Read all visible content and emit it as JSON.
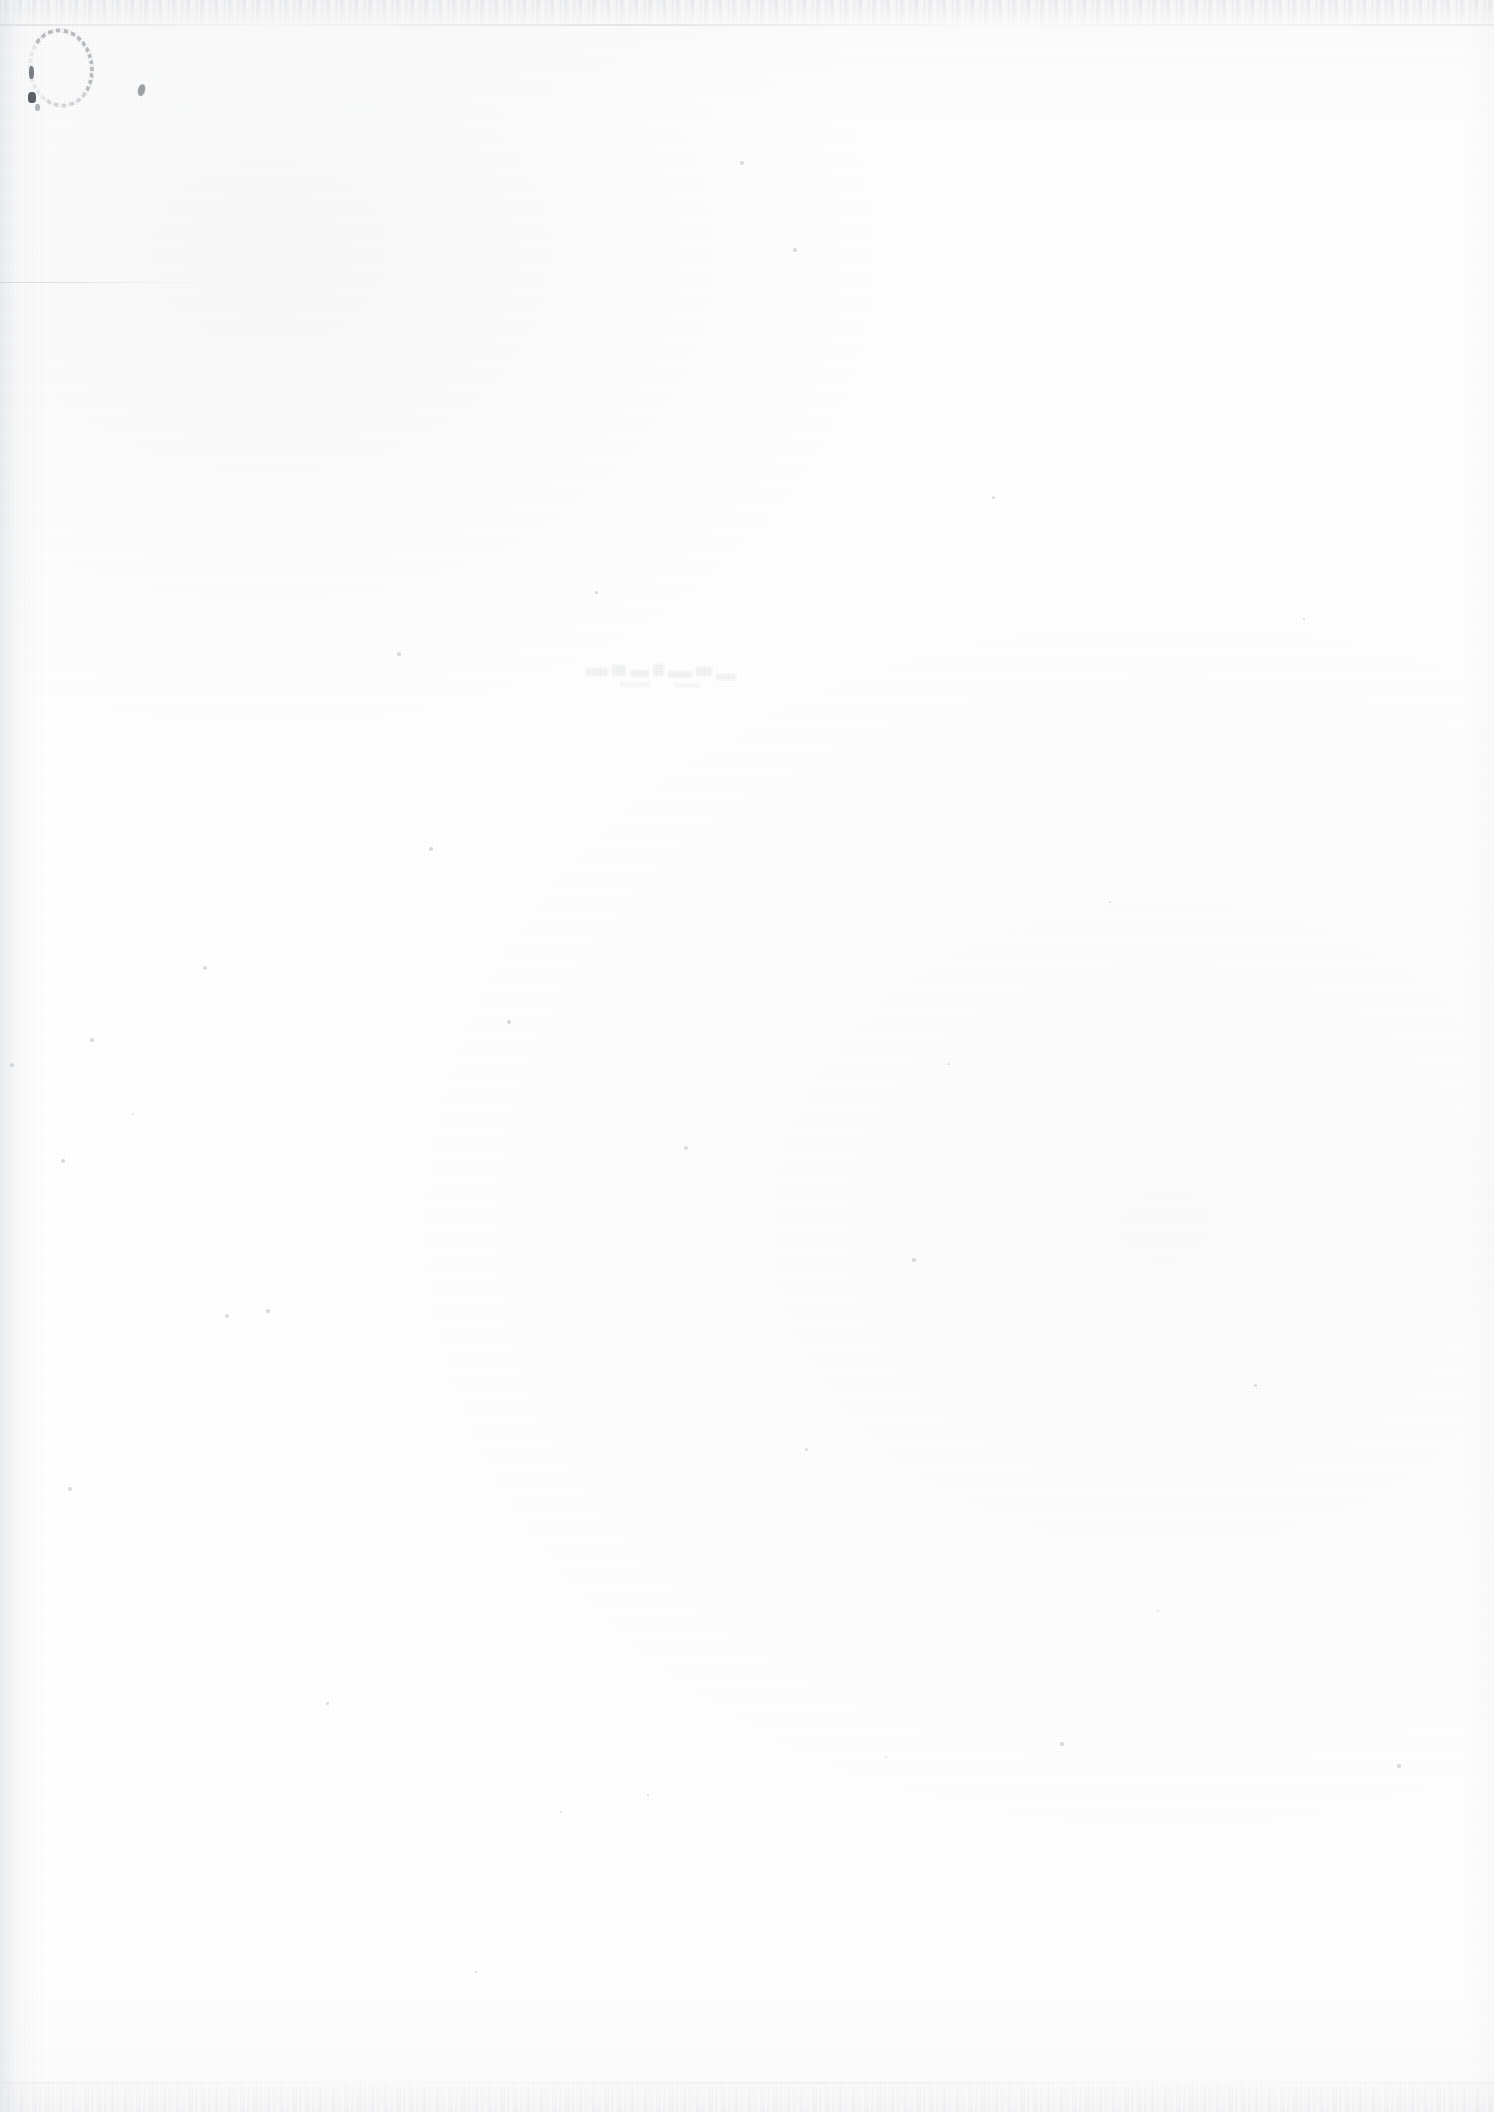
{
  "document": {
    "type": "scanned-page",
    "title": "",
    "page_text": "",
    "body_text": "",
    "visible_text": "",
    "width_px": 1494,
    "height_px": 2112,
    "background_color": "#ffffff",
    "notes_label": ""
  },
  "marks": {
    "oval": {
      "name": "faint ink oval mark",
      "label": "",
      "color": "#686e76",
      "x": 28,
      "y": 28,
      "w": 66,
      "h": 80
    },
    "comma": {
      "name": "faint ink speck",
      "label": "",
      "color": "#606a70",
      "x": 138,
      "y": 84,
      "w": 7,
      "h": 12
    },
    "rule": {
      "name": "faint horizontal hairline",
      "label": "",
      "color": "#c4c8cd",
      "x": 0,
      "y": 282,
      "w": 206,
      "h": 1
    },
    "ghost": {
      "name": "faint bleed-through ghosting",
      "label": "",
      "color": "#c0c4c9",
      "x": 584,
      "y": 660,
      "w": 156,
      "h": 42
    }
  },
  "edges": {
    "top_band_color": "#d6d9dc",
    "bottom_band_color": "#dee1e4",
    "left_gradient_color": "#e9ebed",
    "right_gradient_color": "#f7f8f9"
  },
  "specks": [
    {
      "x": 63,
      "y": 1161,
      "r": 2.0
    },
    {
      "x": 205,
      "y": 968,
      "r": 2.2
    },
    {
      "x": 92,
      "y": 1040,
      "r": 1.6
    },
    {
      "x": 12,
      "y": 1065,
      "r": 1.8
    },
    {
      "x": 133,
      "y": 1114,
      "r": 1.4
    },
    {
      "x": 227,
      "y": 1316,
      "r": 2.4
    },
    {
      "x": 431,
      "y": 849,
      "r": 1.8
    },
    {
      "x": 399,
      "y": 654,
      "r": 1.6
    },
    {
      "x": 509,
      "y": 1022,
      "r": 1.7
    },
    {
      "x": 596,
      "y": 592,
      "r": 1.5
    },
    {
      "x": 686,
      "y": 1148,
      "r": 1.9
    },
    {
      "x": 742,
      "y": 163,
      "r": 2.1
    },
    {
      "x": 795,
      "y": 250,
      "r": 2.0
    },
    {
      "x": 806,
      "y": 1449,
      "r": 1.5
    },
    {
      "x": 914,
      "y": 1260,
      "r": 1.6
    },
    {
      "x": 949,
      "y": 1064,
      "r": 1.4
    },
    {
      "x": 993,
      "y": 497,
      "r": 1.5
    },
    {
      "x": 1062,
      "y": 1744,
      "r": 1.7
    },
    {
      "x": 1110,
      "y": 902,
      "r": 1.3
    },
    {
      "x": 1255,
      "y": 1385,
      "r": 1.5
    },
    {
      "x": 1304,
      "y": 619,
      "r": 1.4
    },
    {
      "x": 1399,
      "y": 1766,
      "r": 1.6
    },
    {
      "x": 327,
      "y": 1703,
      "r": 1.5
    },
    {
      "x": 476,
      "y": 1972,
      "r": 1.4
    },
    {
      "x": 648,
      "y": 1795,
      "r": 1.3
    },
    {
      "x": 1158,
      "y": 1611,
      "r": 1.4
    },
    {
      "x": 70,
      "y": 1489,
      "r": 1.7
    },
    {
      "x": 268,
      "y": 1311,
      "r": 1.6
    },
    {
      "x": 561,
      "y": 1812,
      "r": 1.3
    },
    {
      "x": 886,
      "y": 1757,
      "r": 1.2
    }
  ]
}
